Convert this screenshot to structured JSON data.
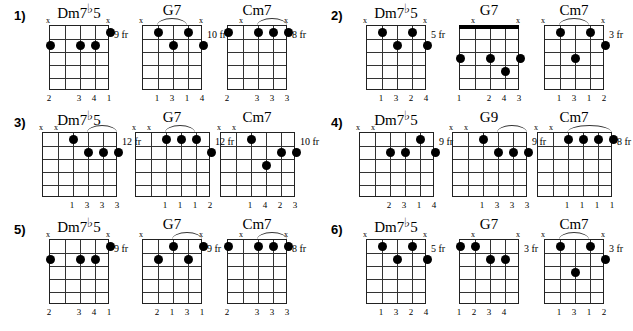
{
  "page": {
    "background": "#ffffff",
    "ink": "#000000"
  },
  "glyphs": {
    "mute": "x",
    "fret_suffix": "fr",
    "flat": "♭"
  },
  "rows": [
    {
      "number": "1)",
      "chords": [
        {
          "name_prefix": "Dm7",
          "name_flat": "♭",
          "name_suffix": "5",
          "name_full": "Dm7♭5",
          "strings": 5,
          "frets": 5,
          "fret_label": "9 fr",
          "nut": false,
          "mutes": [
            1,
            5
          ],
          "dots": [
            {
              "string": 5,
              "fret": 1
            },
            {
              "string": 1,
              "fret": 2
            },
            {
              "string": 3,
              "fret": 2
            },
            {
              "string": 4,
              "fret": 2
            }
          ],
          "arc": null,
          "fingers": [
            {
              "string": 1,
              "label": "2"
            },
            {
              "string": 3,
              "label": "3"
            },
            {
              "string": 4,
              "label": "4"
            },
            {
              "string": 5,
              "label": "1"
            }
          ]
        },
        {
          "name_prefix": "G7",
          "name_flat": "",
          "name_suffix": "",
          "name_full": "G7",
          "strings": 5,
          "frets": 5,
          "fret_label": "10 fr",
          "nut": false,
          "mutes": [
            1,
            5
          ],
          "dots": [
            {
              "string": 2,
              "fret": 1
            },
            {
              "string": 4,
              "fret": 1
            },
            {
              "string": 3,
              "fret": 2
            },
            {
              "string": 5,
              "fret": 2
            }
          ],
          "arc": {
            "from": 2,
            "to": 4
          },
          "fingers": [
            {
              "string": 2,
              "label": "1"
            },
            {
              "string": 3,
              "label": "3"
            },
            {
              "string": 4,
              "label": "1"
            },
            {
              "string": 5,
              "label": "4"
            }
          ]
        },
        {
          "name_prefix": "Cm7",
          "name_flat": "",
          "name_suffix": "",
          "name_full": "Cm7",
          "strings": 5,
          "frets": 5,
          "fret_label": "8 fr",
          "nut": false,
          "mutes": [
            2,
            5
          ],
          "dots": [
            {
              "string": 1,
              "fret": 1
            },
            {
              "string": 3,
              "fret": 1
            },
            {
              "string": 4,
              "fret": 1
            },
            {
              "string": 5,
              "fret": 1
            }
          ],
          "arc": {
            "from": 3,
            "to": 5
          },
          "fingers": [
            {
              "string": 1,
              "label": "2"
            },
            {
              "string": 3,
              "label": "3"
            },
            {
              "string": 4,
              "label": "3"
            },
            {
              "string": 5,
              "label": "3"
            }
          ]
        }
      ]
    },
    {
      "number": "2)",
      "chords": [
        {
          "name_prefix": "Dm7",
          "name_flat": "♭",
          "name_suffix": "5",
          "name_full": "Dm7♭5",
          "strings": 5,
          "frets": 5,
          "fret_label": "5 fr",
          "nut": false,
          "mutes": [
            1,
            5
          ],
          "dots": [
            {
              "string": 2,
              "fret": 1
            },
            {
              "string": 4,
              "fret": 1
            },
            {
              "string": 3,
              "fret": 2
            },
            {
              "string": 5,
              "fret": 2
            }
          ],
          "arc": null,
          "fingers": [
            {
              "string": 2,
              "label": "1"
            },
            {
              "string": 3,
              "label": "3"
            },
            {
              "string": 4,
              "label": "2"
            },
            {
              "string": 5,
              "label": "4"
            }
          ]
        },
        {
          "name_prefix": "G7",
          "name_flat": "",
          "name_suffix": "",
          "name_full": "G7",
          "strings": 5,
          "frets": 5,
          "fret_label": "",
          "nut": true,
          "mutes": [
            2,
            5
          ],
          "dots": [
            {
              "string": 1,
              "fret": 3
            },
            {
              "string": 3,
              "fret": 3
            },
            {
              "string": 5,
              "fret": 3
            },
            {
              "string": 4,
              "fret": 4
            }
          ],
          "arc": null,
          "fingers": [
            {
              "string": 1,
              "label": "1"
            },
            {
              "string": 3,
              "label": "2"
            },
            {
              "string": 4,
              "label": "4"
            },
            {
              "string": 5,
              "label": "3"
            }
          ]
        },
        {
          "name_prefix": "Cm7",
          "name_flat": "",
          "name_suffix": "",
          "name_full": "Cm7",
          "strings": 5,
          "frets": 5,
          "fret_label": "3 fr",
          "nut": false,
          "mutes": [
            1,
            5
          ],
          "dots": [
            {
              "string": 2,
              "fret": 1
            },
            {
              "string": 4,
              "fret": 1
            },
            {
              "string": 5,
              "fret": 2
            },
            {
              "string": 3,
              "fret": 3
            }
          ],
          "arc": {
            "from": 2,
            "to": 4
          },
          "fingers": [
            {
              "string": 2,
              "label": "1"
            },
            {
              "string": 3,
              "label": "3"
            },
            {
              "string": 4,
              "label": "1"
            },
            {
              "string": 5,
              "label": "2"
            }
          ]
        }
      ]
    },
    {
      "number": "3)",
      "chords": [
        {
          "name_prefix": "Dm7",
          "name_flat": "♭",
          "name_suffix": "5",
          "name_full": "Dm7♭5",
          "strings": 6,
          "frets": 5,
          "fret_label": "12 fr",
          "nut": false,
          "mutes": [
            1,
            2
          ],
          "dots": [
            {
              "string": 3,
              "fret": 1
            },
            {
              "string": 4,
              "fret": 2
            },
            {
              "string": 5,
              "fret": 2
            },
            {
              "string": 6,
              "fret": 2
            }
          ],
          "arc": {
            "from": 4,
            "to": 6
          },
          "fingers": [
            {
              "string": 3,
              "label": "1"
            },
            {
              "string": 4,
              "label": "3"
            },
            {
              "string": 5,
              "label": "3"
            },
            {
              "string": 6,
              "label": "3"
            }
          ]
        },
        {
          "name_prefix": "G7",
          "name_flat": "",
          "name_suffix": "",
          "name_full": "G7",
          "strings": 6,
          "frets": 5,
          "fret_label": "12 fr",
          "nut": false,
          "mutes": [
            1,
            2
          ],
          "dots": [
            {
              "string": 3,
              "fret": 1
            },
            {
              "string": 4,
              "fret": 1
            },
            {
              "string": 5,
              "fret": 1
            },
            {
              "string": 6,
              "fret": 2
            }
          ],
          "arc": {
            "from": 3,
            "to": 5
          },
          "fingers": [
            {
              "string": 3,
              "label": "1"
            },
            {
              "string": 4,
              "label": "1"
            },
            {
              "string": 5,
              "label": "1"
            },
            {
              "string": 6,
              "label": "2"
            }
          ]
        },
        {
          "name_prefix": "Cm7",
          "name_flat": "",
          "name_suffix": "",
          "name_full": "Cm7",
          "strings": 6,
          "frets": 5,
          "fret_label": "10 fr",
          "nut": false,
          "mutes": [
            1,
            2
          ],
          "dots": [
            {
              "string": 3,
              "fret": 1
            },
            {
              "string": 5,
              "fret": 2
            },
            {
              "string": 6,
              "fret": 2
            },
            {
              "string": 4,
              "fret": 3
            }
          ],
          "arc": null,
          "fingers": [
            {
              "string": 3,
              "label": "1"
            },
            {
              "string": 4,
              "label": "4"
            },
            {
              "string": 5,
              "label": "2"
            },
            {
              "string": 6,
              "label": "3"
            }
          ]
        }
      ]
    },
    {
      "number": "4)",
      "chords": [
        {
          "name_prefix": "Dm7",
          "name_flat": "♭",
          "name_suffix": "5",
          "name_full": "Dm7♭5",
          "strings": 6,
          "frets": 5,
          "fret_label": "9 fr",
          "nut": false,
          "mutes": [
            1,
            2
          ],
          "dots": [
            {
              "string": 5,
              "fret": 1
            },
            {
              "string": 3,
              "fret": 2
            },
            {
              "string": 4,
              "fret": 2
            },
            {
              "string": 6,
              "fret": 2
            }
          ],
          "arc": null,
          "fingers": [
            {
              "string": 3,
              "label": "2"
            },
            {
              "string": 4,
              "label": "3"
            },
            {
              "string": 5,
              "label": "1"
            },
            {
              "string": 6,
              "label": "4"
            }
          ]
        },
        {
          "name_prefix": "G9",
          "name_flat": "",
          "name_suffix": "",
          "name_full": "G9",
          "strings": 6,
          "frets": 5,
          "fret_label": "9 fr",
          "nut": false,
          "mutes": [
            1,
            2
          ],
          "dots": [
            {
              "string": 3,
              "fret": 1
            },
            {
              "string": 4,
              "fret": 2
            },
            {
              "string": 5,
              "fret": 2
            },
            {
              "string": 6,
              "fret": 2
            }
          ],
          "arc": {
            "from": 4,
            "to": 6
          },
          "fingers": [
            {
              "string": 3,
              "label": "1"
            },
            {
              "string": 4,
              "label": "3"
            },
            {
              "string": 5,
              "label": "3"
            },
            {
              "string": 6,
              "label": "3"
            }
          ]
        },
        {
          "name_prefix": "Cm7",
          "name_flat": "",
          "name_suffix": "",
          "name_full": "Cm7",
          "strings": 6,
          "frets": 5,
          "fret_label": "8 fr",
          "nut": false,
          "mutes": [
            1,
            2
          ],
          "dots": [
            {
              "string": 3,
              "fret": 1
            },
            {
              "string": 4,
              "fret": 1
            },
            {
              "string": 5,
              "fret": 1
            },
            {
              "string": 6,
              "fret": 1
            }
          ],
          "arc": {
            "from": 3,
            "to": 6
          },
          "fingers": [
            {
              "string": 3,
              "label": "1"
            },
            {
              "string": 4,
              "label": "1"
            },
            {
              "string": 5,
              "label": "1"
            },
            {
              "string": 6,
              "label": "1"
            }
          ]
        }
      ]
    },
    {
      "number": "5)",
      "chords": [
        {
          "name_prefix": "Dm7",
          "name_flat": "♭",
          "name_suffix": "5",
          "name_full": "Dm7♭5",
          "strings": 5,
          "frets": 5,
          "fret_label": "9 fr",
          "nut": false,
          "mutes": [
            1,
            5
          ],
          "dots": [
            {
              "string": 5,
              "fret": 1
            },
            {
              "string": 1,
              "fret": 2
            },
            {
              "string": 3,
              "fret": 2
            },
            {
              "string": 4,
              "fret": 2
            }
          ],
          "arc": null,
          "fingers": [
            {
              "string": 1,
              "label": "2"
            },
            {
              "string": 3,
              "label": "3"
            },
            {
              "string": 4,
              "label": "4"
            },
            {
              "string": 5,
              "label": "1"
            }
          ]
        },
        {
          "name_prefix": "G7",
          "name_flat": "",
          "name_suffix": "",
          "name_full": "G7",
          "strings": 5,
          "frets": 5,
          "fret_label": "9 fr",
          "nut": false,
          "mutes": [
            1,
            5
          ],
          "dots": [
            {
              "string": 3,
              "fret": 1
            },
            {
              "string": 5,
              "fret": 1
            },
            {
              "string": 2,
              "fret": 2
            },
            {
              "string": 4,
              "fret": 2
            }
          ],
          "arc": {
            "from": 3,
            "to": 5
          },
          "fingers": [
            {
              "string": 2,
              "label": "2"
            },
            {
              "string": 3,
              "label": "1"
            },
            {
              "string": 4,
              "label": "3"
            },
            {
              "string": 5,
              "label": "1"
            }
          ]
        },
        {
          "name_prefix": "Cm7",
          "name_flat": "",
          "name_suffix": "",
          "name_full": "Cm7",
          "strings": 5,
          "frets": 5,
          "fret_label": "8 fr",
          "nut": false,
          "mutes": [
            2,
            5
          ],
          "dots": [
            {
              "string": 1,
              "fret": 1
            },
            {
              "string": 3,
              "fret": 1
            },
            {
              "string": 4,
              "fret": 1
            },
            {
              "string": 5,
              "fret": 1
            }
          ],
          "arc": {
            "from": 3,
            "to": 5
          },
          "fingers": [
            {
              "string": 1,
              "label": "2"
            },
            {
              "string": 3,
              "label": "3"
            },
            {
              "string": 4,
              "label": "3"
            },
            {
              "string": 5,
              "label": "3"
            }
          ]
        }
      ]
    },
    {
      "number": "6)",
      "chords": [
        {
          "name_prefix": "Dm7",
          "name_flat": "♭",
          "name_suffix": "5",
          "name_full": "Dm7♭5",
          "strings": 5,
          "frets": 5,
          "fret_label": "5 fr",
          "nut": false,
          "mutes": [
            1,
            5
          ],
          "dots": [
            {
              "string": 2,
              "fret": 1
            },
            {
              "string": 4,
              "fret": 1
            },
            {
              "string": 3,
              "fret": 2
            },
            {
              "string": 5,
              "fret": 2
            }
          ],
          "arc": null,
          "fingers": [
            {
              "string": 2,
              "label": "1"
            },
            {
              "string": 3,
              "label": "3"
            },
            {
              "string": 4,
              "label": "2"
            },
            {
              "string": 5,
              "label": "4"
            }
          ]
        },
        {
          "name_prefix": "G7",
          "name_flat": "",
          "name_suffix": "",
          "name_full": "G7",
          "strings": 5,
          "frets": 5,
          "fret_label": "3 fr",
          "nut": false,
          "mutes": [
            2,
            5
          ],
          "dots": [
            {
              "string": 1,
              "fret": 1
            },
            {
              "string": 2,
              "fret": 1
            },
            {
              "string": 3,
              "fret": 2
            },
            {
              "string": 4,
              "fret": 2
            }
          ],
          "arc": null,
          "fingers": [
            {
              "string": 1,
              "label": "1"
            },
            {
              "string": 2,
              "label": "2"
            },
            {
              "string": 3,
              "label": "3"
            },
            {
              "string": 4,
              "label": "4"
            }
          ]
        },
        {
          "name_prefix": "Cm7",
          "name_flat": "",
          "name_suffix": "",
          "name_full": "Cm7",
          "strings": 5,
          "frets": 5,
          "fret_label": "3 fr",
          "nut": false,
          "mutes": [
            1,
            5
          ],
          "dots": [
            {
              "string": 2,
              "fret": 1
            },
            {
              "string": 4,
              "fret": 1
            },
            {
              "string": 5,
              "fret": 2
            },
            {
              "string": 3,
              "fret": 3
            }
          ],
          "arc": {
            "from": 2,
            "to": 4
          },
          "fingers": [
            {
              "string": 2,
              "label": "1"
            },
            {
              "string": 3,
              "label": "3"
            },
            {
              "string": 4,
              "label": "1"
            },
            {
              "string": 5,
              "label": "2"
            }
          ]
        }
      ]
    }
  ]
}
